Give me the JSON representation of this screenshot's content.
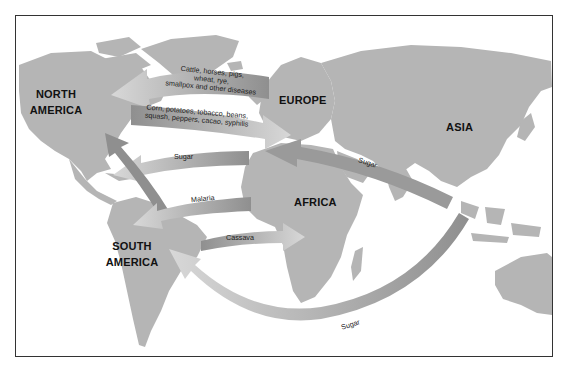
{
  "map": {
    "title": "",
    "colors": {
      "land": "#b5b5b5",
      "water": "#ffffff",
      "arrow": "#8f8f8f",
      "frame": "#333333",
      "label": "#111111"
    },
    "regions": [
      {
        "id": "north-america",
        "label_line1": "NORTH",
        "label_line2": "AMERICA"
      },
      {
        "id": "europe",
        "label_line1": "EUROPE",
        "label_line2": ""
      },
      {
        "id": "asia",
        "label_line1": "ASIA",
        "label_line2": ""
      },
      {
        "id": "africa",
        "label_line1": "AFRICA",
        "label_line2": ""
      },
      {
        "id": "south-america",
        "label_line1": "SOUTH",
        "label_line2": "AMERICA"
      }
    ],
    "flows": [
      {
        "id": "europe-to-americas",
        "from": "Europe",
        "to": "North America",
        "label_line1": "Cattle, horses, pigs,",
        "label_line2": "wheat, rye,",
        "label_line3": "smallpox and other diseases"
      },
      {
        "id": "americas-to-europe",
        "from": "North America",
        "to": "Europe",
        "label_line1": "Corn, potatoes, tobacco, beans,",
        "label_line2": "squash, peppers, cacao, syphilis"
      },
      {
        "id": "africa-to-caribbean-sugar",
        "from": "Africa",
        "to": "Caribbean",
        "label": "Sugar"
      },
      {
        "id": "asia-to-africa-sugar",
        "from": "Asia",
        "to": "Africa",
        "label": "Sugar"
      },
      {
        "id": "africa-to-south-america-malaria",
        "from": "Africa",
        "to": "South America",
        "label": "Malaria"
      },
      {
        "id": "south-america-to-africa-cassava",
        "from": "South America",
        "to": "Africa",
        "label": "Cassava"
      },
      {
        "id": "asia-to-south-america-sugar",
        "from": "Southeast Asia",
        "to": "South America",
        "label": "Sugar"
      }
    ]
  }
}
